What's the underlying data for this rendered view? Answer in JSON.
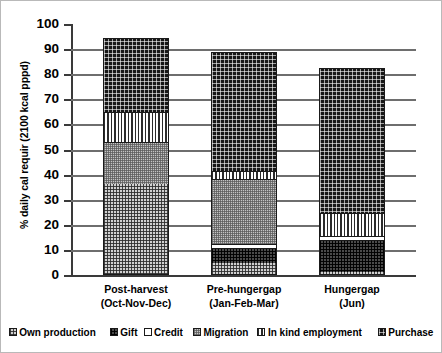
{
  "chart_data": {
    "type": "bar",
    "stacked": true,
    "title": "",
    "subtitle": "",
    "xlabel": "",
    "ylabel": "% daily cal requir (2100 kcal pppd)",
    "ylim": [
      0,
      100
    ],
    "ytick_labels": [
      "100",
      "90",
      "80",
      "70",
      "60",
      "50",
      "40",
      "30",
      "20",
      "10",
      "0"
    ],
    "ytick_values": [
      100,
      90,
      80,
      70,
      60,
      50,
      40,
      30,
      20,
      10,
      0
    ],
    "grid": "horizontal",
    "legend_position": "bottom",
    "categories": [
      "Post-harvest (Oct-Nov-Dec)",
      "Pre-hungergap (Jan-Feb-Mar)",
      "Hungergap (Jun)"
    ],
    "category_labels": [
      {
        "line1": "Post-harvest",
        "line2": "(Oct-Nov-Dec)"
      },
      {
        "line1": "Pre-hungergap",
        "line2": "(Jan-Feb-Mar)"
      },
      {
        "line1": "Hungergap",
        "line2": "(Jun)"
      }
    ],
    "series": [
      {
        "name": "Own production",
        "pattern": "checkered-light",
        "values": [
          36.0,
          4.5,
          0.8
        ]
      },
      {
        "name": "Gift",
        "pattern": "checkered-dark",
        "values": [
          0.0,
          6.0,
          12.7
        ]
      },
      {
        "name": "Credit",
        "pattern": "white",
        "values": [
          0.0,
          1.5,
          1.5
        ]
      },
      {
        "name": "Migration",
        "pattern": "fine-mesh-grey",
        "values": [
          16.5,
          26.0,
          0.0
        ]
      },
      {
        "name": "In kind employment",
        "pattern": "vertical-stripes",
        "values": [
          12.0,
          3.0,
          9.5
        ]
      },
      {
        "name": "Purchase",
        "pattern": "dotted-black",
        "values": [
          30.0,
          48.0,
          58.0
        ]
      }
    ],
    "bar_totals": [
      94.5,
      89.0,
      82.5
    ],
    "colors": {
      "own_production": "#d0d0d0",
      "gift": "#4a4a4a",
      "credit": "#ffffff",
      "migration": "#c4c4c4",
      "in_kind_employment": "#ffffff",
      "purchase": "#171717",
      "axis": "#3a3a3a",
      "gridline": "#6e6e6e",
      "outline": "#1a1a1a",
      "background": "#ffffff"
    }
  },
  "legend": {
    "items": [
      {
        "label": "Own production",
        "swatch": "own_production"
      },
      {
        "label": "Gift",
        "swatch": "gift"
      },
      {
        "label": "Credit",
        "swatch": "credit"
      },
      {
        "label": "Migration",
        "swatch": "migration"
      },
      {
        "label": "In kind employment",
        "swatch": "in_kind_employment"
      },
      {
        "label": "Purchase",
        "swatch": "purchase"
      }
    ]
  }
}
